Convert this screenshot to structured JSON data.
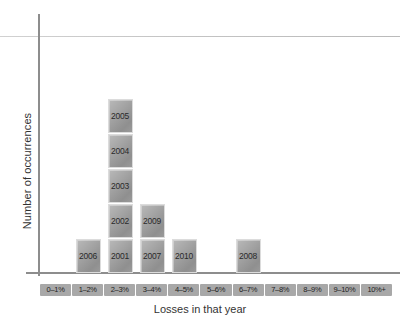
{
  "chart_data": {
    "type": "bar",
    "title": "",
    "subtitle": "",
    "xlabel": "Losses in that year",
    "ylabel": "Number of occurrences",
    "categories": [
      "0–1%",
      "1–2%",
      "2–3%",
      "3–4%",
      "4–5%",
      "5–6%",
      "6–7%",
      "7–8%",
      "8–9%",
      "9–10%",
      "10%+"
    ],
    "values": [
      0,
      1,
      5,
      2,
      1,
      0,
      1,
      0,
      0,
      0,
      0
    ],
    "stacks": [
      [],
      [
        "2006"
      ],
      [
        "2001",
        "2002",
        "2003",
        "2004",
        "2005"
      ],
      [
        "2007",
        "2009"
      ],
      [
        "2010"
      ],
      [],
      [
        "2008"
      ],
      [],
      [],
      [],
      []
    ],
    "ylim": [
      0,
      7
    ],
    "grid": false,
    "legend": false,
    "legend_position": "none",
    "annotations": "Each stacked cell is labelled with the year it represents.",
    "bar_fill_light": "#b9b9b9",
    "bar_fill_dark": "#8f8f8f",
    "bar_border": "#dcdcdc",
    "tick_box_color": "#a8a8a8",
    "axis_color": "#8d8d8d",
    "background": "#ffffff"
  },
  "axes": {
    "y_title": "Number of occurrences",
    "x_title": "Losses in that year"
  }
}
